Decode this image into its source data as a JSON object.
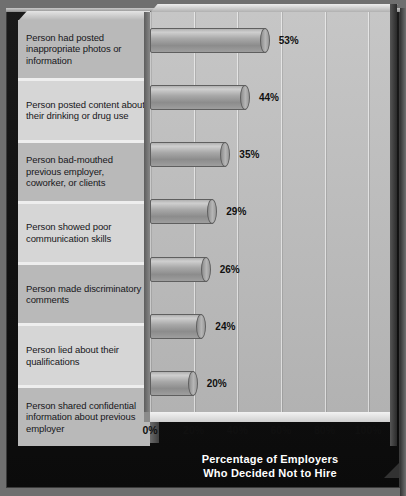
{
  "chart_data": {
    "type": "bar",
    "orientation": "horizontal",
    "title": "Percentage of Employers Who Decided Not to Hire",
    "title_line1": "Percentage of Employers",
    "title_line2": "Who Decided Not to Hire",
    "xlabel": "",
    "ylabel": "",
    "xlim": [
      0,
      110
    ],
    "grid": true,
    "legend": "none",
    "tick_labels": [
      "0%",
      "20%",
      "40%",
      "60%",
      "80%",
      "100%"
    ],
    "tick_values": [
      0,
      20,
      40,
      60,
      80,
      100
    ],
    "categories": [
      "Person had posted inappropriate photos or information",
      "Person posted content about their drinking or drug use",
      "Person bad-mouthed previous employer, coworker, or clients",
      "Person showed poor communication skills",
      "Person made discriminatory comments",
      "Person lied about their qualifications",
      "Person shared confidential information about previous employer"
    ],
    "values": [
      53,
      44,
      35,
      29,
      26,
      24,
      20
    ],
    "value_labels": [
      "53%",
      "44%",
      "35%",
      "29%",
      "26%",
      "24%",
      "20%"
    ]
  },
  "colors": {
    "frame": "#111111",
    "panel": "#bdbdbd",
    "label_panel_light": "#d6d6d6",
    "label_panel_dark": "#b9b9b9",
    "bar": "#a8a8a8",
    "title_text": "#ffffff",
    "value_text": "#101010"
  }
}
